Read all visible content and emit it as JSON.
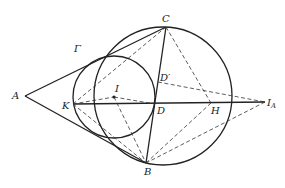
{
  "diagram": {
    "type": "geometry",
    "labels": {
      "A": "A",
      "B": "B",
      "C": "C",
      "Gamma": "Γ",
      "I": "I",
      "K": "K",
      "D": "D",
      "D_prime": "D′",
      "H": "H",
      "I_A_main": "I",
      "I_A_sub": "A"
    },
    "points": {
      "A": [
        25,
        96
      ],
      "B": [
        146,
        163
      ],
      "C": [
        166,
        27
      ],
      "I": [
        114,
        97
      ],
      "K": [
        73,
        104
      ],
      "D": [
        155,
        104
      ],
      "D_prime": [
        158,
        82
      ],
      "H": [
        211,
        103
      ],
      "I_A": [
        265,
        102
      ]
    },
    "circles": {
      "circumcircle": {
        "cx": 163,
        "cy": 96,
        "r": 69
      },
      "incircle": {
        "cx": 114,
        "cy": 97,
        "r": 41
      }
    },
    "colors": {
      "stroke": "#222222",
      "background": "#ffffff"
    }
  }
}
